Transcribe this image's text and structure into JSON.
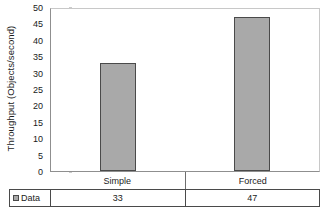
{
  "chart_data": {
    "type": "bar",
    "title": "",
    "categories": [
      "Simple",
      "Forced"
    ],
    "values": [
      33,
      47
    ],
    "series": [
      {
        "name": "Data",
        "values": [
          33,
          47
        ]
      }
    ],
    "xlabel": "",
    "ylabel": "Throughput (Objects/second)",
    "ylim": [
      0,
      50
    ],
    "ytick_labels": [
      "0",
      "5",
      "10",
      "15",
      "20",
      "25",
      "30",
      "35",
      "40",
      "45",
      "50"
    ],
    "ytick_values": [
      0,
      5,
      10,
      15,
      20,
      25,
      30,
      35,
      40,
      45,
      50
    ],
    "grid": false,
    "legend_position": "bottom-table",
    "bar_color": "#a9a9a9",
    "bar_border_color": "#4a4a4a",
    "plot_border_color": "#8f8f8f"
  },
  "data_table": {
    "legend_label": "Data",
    "headers": [
      "Simple",
      "Forced"
    ],
    "values": [
      "33",
      "47"
    ]
  }
}
